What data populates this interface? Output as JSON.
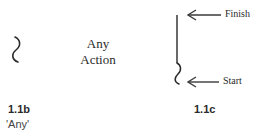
{
  "figure_b": {
    "symbol": "squiggle-icon",
    "action_text_line1": "Any",
    "action_text_line2": "Action",
    "label": "1.1b",
    "caption": "'Any'"
  },
  "figure_c": {
    "symbol": "line-with-squiggle-icon",
    "finish_label": "Finish",
    "start_label": "Start",
    "label": "1.1c"
  },
  "colors": {
    "stroke": "#2a2a2a",
    "arrow": "#3a3a3a",
    "background": "#ffffff"
  }
}
